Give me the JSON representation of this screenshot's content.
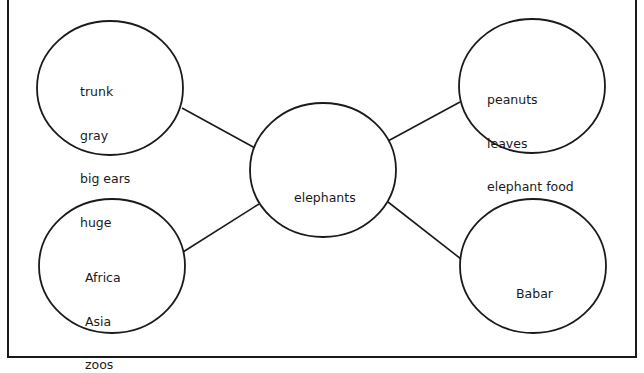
{
  "diagram": {
    "type": "concept-web",
    "center": {
      "id": "center",
      "label": "elephants"
    },
    "nodes": [
      {
        "id": "characteristics",
        "position": "top-left",
        "lines": [
          "trunk",
          "gray",
          "big ears",
          "huge"
        ]
      },
      {
        "id": "food",
        "position": "top-right",
        "lines": [
          "peanuts",
          "leaves",
          "elephant food"
        ]
      },
      {
        "id": "habitat",
        "position": "bottom-left",
        "lines": [
          "Africa",
          "Asia",
          "zoos"
        ]
      },
      {
        "id": "stories",
        "position": "bottom-right",
        "lines": [
          "Babar"
        ]
      }
    ],
    "edges": [
      {
        "from": "center",
        "to": "characteristics"
      },
      {
        "from": "center",
        "to": "food"
      },
      {
        "from": "center",
        "to": "habitat"
      },
      {
        "from": "center",
        "to": "stories"
      }
    ],
    "colors": {
      "stroke": "#1a1a1a",
      "background": "#ffffff",
      "text": "#1a1a1a"
    }
  }
}
